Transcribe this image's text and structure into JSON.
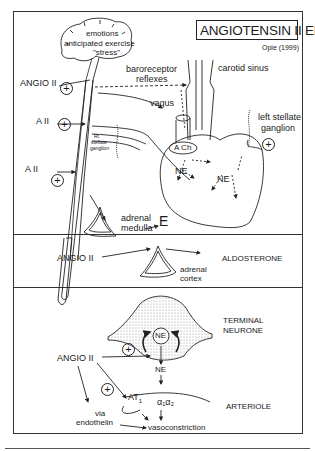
{
  "title": "ANGIOTENSIN II EFFECTS",
  "credit": "Opie (1999)",
  "panel_top": {
    "brain_labels": [
      "emotions",
      "anticipated exercise",
      "\"stress\""
    ],
    "angio_label": "ANGIO II",
    "a2_upper": "A II",
    "a2_lower": "A II",
    "baroreceptor": "baroreceptor",
    "reflexes": "reflexes",
    "carotid_sinus": "carotid sinus",
    "vagus": "vagus",
    "left_stellate": "left stellate",
    "ganglion": "ganglion",
    "rt_stellate": [
      "Rt",
      "stellate",
      "ganglion"
    ],
    "ach": "A Ch",
    "ne_left": "NE",
    "ne_right": "NE",
    "adrenal": "adrenal",
    "medulla": "medulla",
    "epinephrine": "E",
    "plus_sign": "+"
  },
  "panel_middle": {
    "angio_label": "ANGIO II",
    "adrenal": "adrenal",
    "cortex": "cortex",
    "aldosterone": "ALDOSTERONE"
  },
  "panel_bottom": {
    "terminal": "TERMINAL",
    "neurone": "NEURONE",
    "ne_vesicle": "NE",
    "ne_released": "NE",
    "angio_label": "ANGIO II",
    "at1": "AT",
    "at1_sub": "1",
    "alpha": "α₁α₂",
    "arteriole": "ARTERIOLE",
    "via": "via",
    "endothelin": "endothelin",
    "vasoconstriction": "vasoconstriction",
    "plus_sign": "+"
  }
}
